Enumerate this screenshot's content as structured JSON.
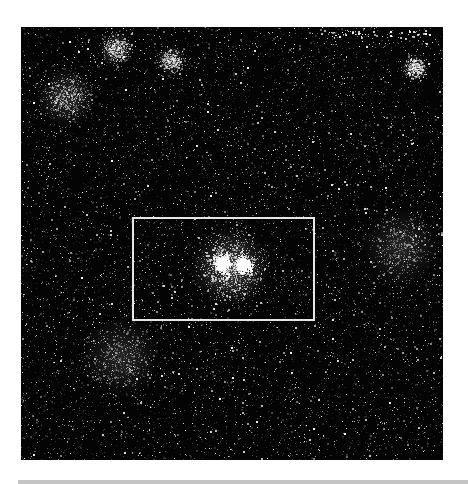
{
  "image": {
    "subject": "star-field",
    "background_color": "#040404",
    "star_color": "#ffffff",
    "highlight_box": {
      "label": "region-of-interest",
      "color": "#e6e6e6",
      "contains": "twin-star-cluster"
    },
    "clusters": [
      {
        "name": "twin-cluster-left",
        "intensity": "bright"
      },
      {
        "name": "twin-cluster-right",
        "intensity": "bright"
      },
      {
        "name": "top-left-cluster",
        "intensity": "faint"
      },
      {
        "name": "top-center-cluster",
        "intensity": "faint"
      },
      {
        "name": "top-right-cluster",
        "intensity": "faint"
      },
      {
        "name": "left-edge-cluster",
        "intensity": "faint"
      }
    ],
    "annotation_text": ""
  },
  "page": {
    "bottom_rule_color": "#c4c4c4"
  }
}
